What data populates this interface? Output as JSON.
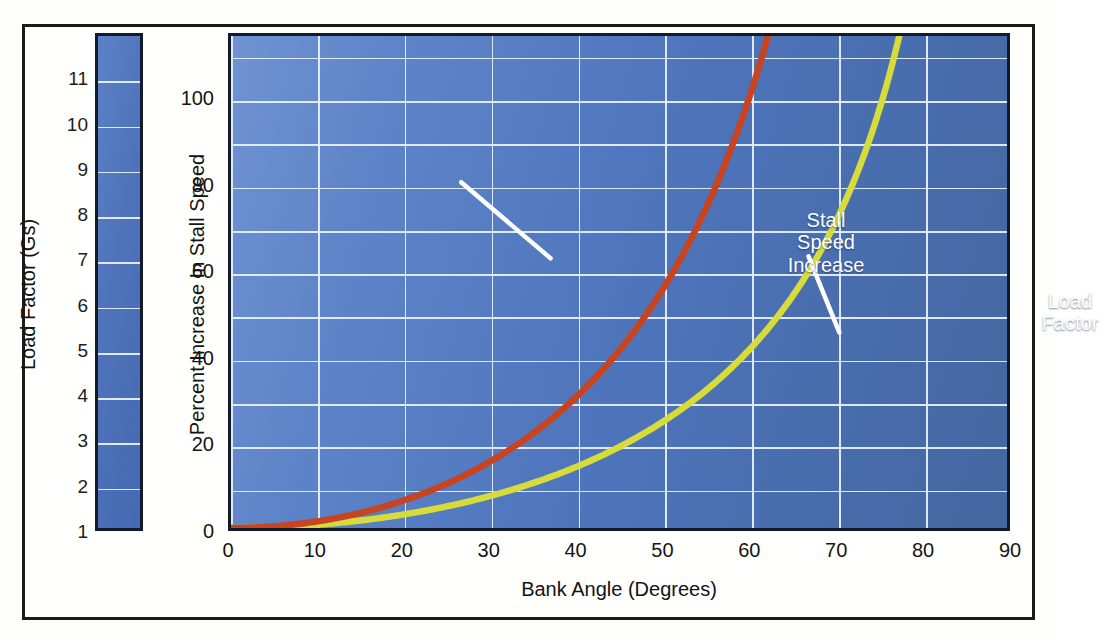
{
  "figure": {
    "frame_color": "#1b1b1b",
    "plot_bg_blue": "#4e74bc",
    "gridline_color": "#eaf2fb"
  },
  "left_scale": {
    "title": "Load Factor (Gs)",
    "ticks": [
      1,
      2,
      3,
      4,
      5,
      6,
      7,
      8,
      9,
      10,
      11
    ],
    "min": 1,
    "max": 12
  },
  "annotations": {
    "stall": {
      "lines": [
        "Stall",
        "Speed",
        "Increase"
      ],
      "color": "#ffffff"
    },
    "load": {
      "lines": [
        "Load",
        "Factor"
      ],
      "color": "#ffffff"
    }
  },
  "chart_data": {
    "type": "line",
    "title": "",
    "xlabel": "Bank Angle (Degrees)",
    "ylabel": "Percent Increase In Stall Speed",
    "y2label": "Load Factor (Gs)",
    "xlim": [
      0,
      90
    ],
    "ylim": [
      0,
      115
    ],
    "xticks": [
      0,
      10,
      20,
      30,
      40,
      50,
      60,
      70,
      80,
      90
    ],
    "yticks": [
      0,
      20,
      40,
      60,
      80,
      100
    ],
    "y_minor_step": 10,
    "x_minor_step": 10,
    "grid": true,
    "legend": "annotated-inline",
    "series": [
      {
        "name": "Stall Speed Increase",
        "color": "#d8dc3a",
        "x": [
          0,
          5,
          10,
          15,
          20,
          25,
          30,
          35,
          40,
          45,
          50,
          55,
          60,
          65,
          70,
          75,
          78,
          80,
          82,
          84,
          85
        ],
        "values": [
          0,
          0.2,
          0.8,
          1.7,
          3.2,
          5.0,
          7.5,
          10.5,
          14.2,
          18.9,
          24.7,
          32.0,
          41.4,
          53.7,
          71.0,
          96.6,
          119.2,
          139.8,
          169.0,
          213.6,
          247.3
        ]
      },
      {
        "name": "Load Factor",
        "color": "#c8431e",
        "note": "plotted as (load factor - 1) x 100 on the percent axis; right-hand scale 1-12 Gs",
        "x": [
          0,
          10,
          20,
          30,
          40,
          45,
          50,
          55,
          60,
          65,
          70,
          72,
          74,
          76,
          78,
          80,
          82,
          84,
          85,
          86
        ],
        "values": [
          0,
          1.5,
          6.4,
          15.5,
          30.5,
          41.4,
          55.6,
          74.3,
          100.0,
          136.6,
          192.4,
          223.6,
          262.8,
          313.1,
          380.5,
          475.9,
          618.6,
          856.7,
          1047.2,
          1330.1
        ],
        "load_factor_gs": [
          1.0,
          1.02,
          1.06,
          1.15,
          1.31,
          1.41,
          1.56,
          1.74,
          2.0,
          2.37,
          2.92,
          3.24,
          3.63,
          4.13,
          4.81,
          5.76,
          7.19,
          9.57,
          11.47,
          14.3
        ]
      }
    ]
  }
}
